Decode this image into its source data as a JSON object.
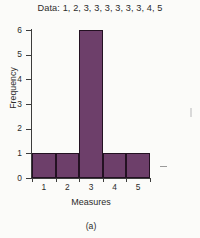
{
  "chart_data": {
    "type": "bar",
    "title": "Data: 1, 2, 3, 3, 3, 3, 3, 3, 4, 5",
    "xlabel": "Measures",
    "ylabel": "Frequency",
    "categories": [
      "1",
      "2",
      "3",
      "4",
      "5"
    ],
    "values": [
      1,
      1,
      6,
      1,
      1
    ],
    "ylim": [
      0,
      6
    ],
    "yticks": [
      "0",
      "1",
      "2",
      "3",
      "4",
      "5",
      "6"
    ],
    "grid": false,
    "legend": false,
    "bar_style": "contiguous-histogram",
    "colors": {
      "bar_fill": "#6d3f6a",
      "bar_edge": "#231122",
      "axis": "#3c3c3c",
      "text": "#2b2b2b",
      "background": "#fbfbf9"
    }
  },
  "caption": "(a)"
}
